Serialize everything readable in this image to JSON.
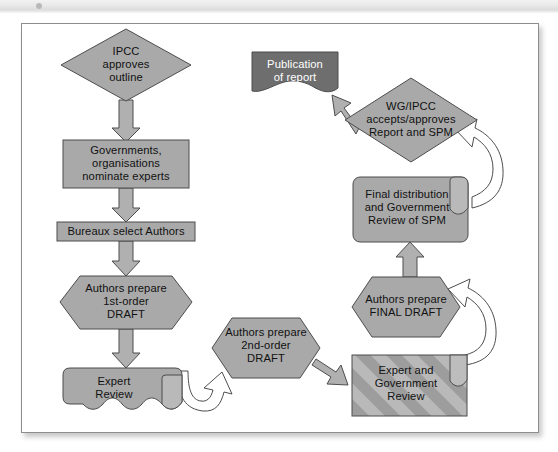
{
  "figure": {
    "type": "flowchart",
    "colors": {
      "shape_fill": "#a9a9a9",
      "shape_fill_light": "#b6b6b6",
      "shape_stroke": "#4d4d4d",
      "publication_fill": "#6e6e6e",
      "text_dark": "#111111",
      "text_light": "#ffffff",
      "arrow_fill": "#b0b0b0",
      "arrow_stroke": "#4d4d4d",
      "curve_fill": "#ffffff",
      "frame_border": "#8d8d8d",
      "page_background": "#ffffff"
    }
  },
  "nodes": [
    {
      "id": "ipcc-approves-outline",
      "shape": "diamond",
      "style": "solid",
      "lines": [
        "IPCC",
        "approves",
        "outline"
      ]
    },
    {
      "id": "governments-nominate-experts",
      "shape": "rectangle",
      "style": "solid",
      "lines": [
        "Governments,",
        "organisations",
        "nominate experts"
      ]
    },
    {
      "id": "bureaux-select-authors",
      "shape": "rectangle",
      "style": "solid",
      "lines": [
        "Bureaux select Authors"
      ]
    },
    {
      "id": "authors-prepare-first-order-draft",
      "shape": "hexagon",
      "style": "solid",
      "lines": [
        "Authors prepare",
        "1st-order",
        "DRAFT"
      ]
    },
    {
      "id": "expert-review",
      "shape": "document",
      "style": "solid",
      "lines": [
        "Expert",
        "Review"
      ]
    },
    {
      "id": "authors-prepare-second-order-draft",
      "shape": "hexagon",
      "style": "solid",
      "lines": [
        "Authors prepare",
        "2nd-order",
        "DRAFT"
      ]
    },
    {
      "id": "expert-and-government-review",
      "shape": "document",
      "style": "striped",
      "lines": [
        "Expert and",
        "Government",
        "Review"
      ]
    },
    {
      "id": "authors-prepare-final-draft",
      "shape": "hexagon",
      "style": "solid",
      "lines": [
        "Authors prepare",
        "FINAL DRAFT"
      ]
    },
    {
      "id": "final-distribution-government-review-spm",
      "shape": "document",
      "style": "solid",
      "lines": [
        "Final distribution",
        "and Government",
        "Review of SPM"
      ]
    },
    {
      "id": "wg-ipcc-accepts-approves",
      "shape": "diamond",
      "style": "solid",
      "lines": [
        "WG/IPCC",
        "accepts/approves",
        "Report and SPM"
      ]
    },
    {
      "id": "publication-of-report",
      "shape": "wave-document",
      "style": "dark",
      "lines": [
        "Publication",
        "of report"
      ]
    }
  ],
  "edges": [
    {
      "from": "ipcc-approves-outline",
      "to": "governments-nominate-experts",
      "style": "block-arrow-down"
    },
    {
      "from": "governments-nominate-experts",
      "to": "bureaux-select-authors",
      "style": "block-arrow-down"
    },
    {
      "from": "bureaux-select-authors",
      "to": "authors-prepare-first-order-draft",
      "style": "block-arrow-down"
    },
    {
      "from": "authors-prepare-first-order-draft",
      "to": "expert-review",
      "style": "block-arrow-down"
    },
    {
      "from": "expert-review",
      "to": "authors-prepare-second-order-draft",
      "style": "curved-arrow"
    },
    {
      "from": "authors-prepare-second-order-draft",
      "to": "expert-and-government-review",
      "style": "block-arrow-right"
    },
    {
      "from": "expert-and-government-review",
      "to": "authors-prepare-final-draft",
      "style": "curved-arrow"
    },
    {
      "from": "authors-prepare-final-draft",
      "to": "final-distribution-government-review-spm",
      "style": "block-arrow-up"
    },
    {
      "from": "final-distribution-government-review-spm",
      "to": "wg-ipcc-accepts-approves",
      "style": "curved-arrow"
    },
    {
      "from": "wg-ipcc-accepts-approves",
      "to": "publication-of-report",
      "style": "block-arrow-up-left"
    }
  ]
}
